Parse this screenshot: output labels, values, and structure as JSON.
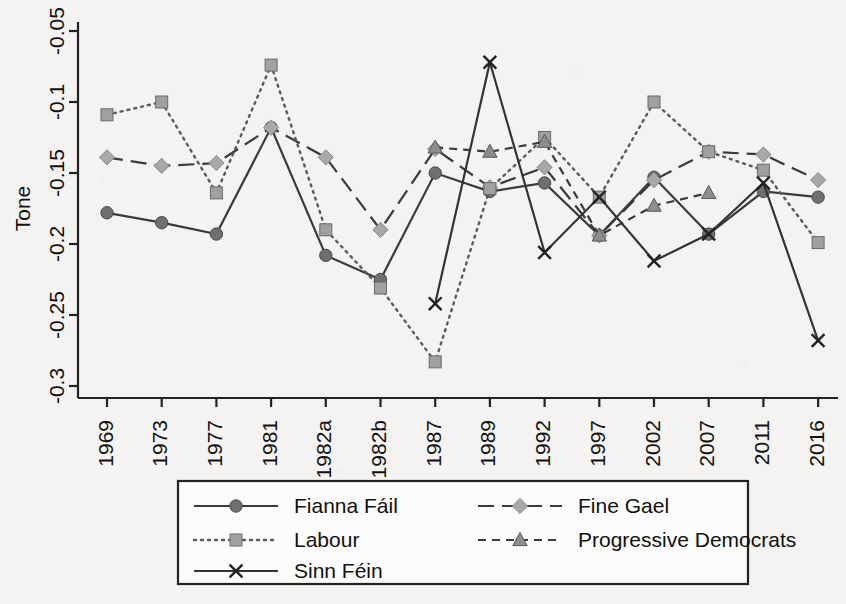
{
  "chart_data": {
    "type": "line",
    "title": "",
    "xlabel": "",
    "ylabel": "Tone",
    "ylim": [
      -0.3,
      -0.05
    ],
    "yticks": [
      "-0.05",
      "-0.1",
      "-0.15",
      "-0.2",
      "-0.25",
      "-0.3"
    ],
    "ytick_values": [
      -0.05,
      -0.1,
      -0.15,
      -0.2,
      -0.25,
      -0.3
    ],
    "grid": false,
    "legend_position": "bottom",
    "categories": [
      "1969",
      "1973",
      "1977",
      "1981",
      "1982a",
      "1982b",
      "1987",
      "1989",
      "1992",
      "1997",
      "2002",
      "2007",
      "2011",
      "2016"
    ],
    "series": [
      {
        "name": "Fianna Fáil",
        "marker": "circle",
        "dash": "solid",
        "color": "#6f6f6f",
        "line_color": "#3a3a3a",
        "values": [
          -0.178,
          -0.185,
          -0.193,
          -0.118,
          -0.208,
          -0.225,
          -0.15,
          -0.163,
          -0.157,
          -0.194,
          -0.153,
          -0.193,
          -0.163,
          -0.167
        ]
      },
      {
        "name": "Fine Gael",
        "marker": "diamond",
        "dash": "longdash",
        "color": "#a8a8a8",
        "line_color": "#3a3a3a",
        "values": [
          -0.139,
          -0.145,
          -0.143,
          -0.118,
          -0.139,
          -0.19,
          -0.133,
          -0.16,
          -0.146,
          -0.194,
          -0.155,
          -0.135,
          -0.137,
          -0.155
        ]
      },
      {
        "name": "Labour",
        "marker": "square",
        "dash": "dotted",
        "color": "#a0a0a0",
        "line_color": "#5a5a5a",
        "values": [
          -0.109,
          -0.1,
          -0.164,
          -0.074,
          -0.19,
          -0.231,
          -0.283,
          -0.161,
          -0.125,
          -0.167,
          -0.1,
          -0.135,
          -0.148,
          -0.199
        ]
      },
      {
        "name": "Progressive Democrats",
        "marker": "triangle",
        "dash": "dashed",
        "color": "#8d8d8d",
        "line_color": "#3a3a3a",
        "values": [
          null,
          null,
          null,
          null,
          null,
          null,
          -0.132,
          -0.135,
          -0.128,
          -0.194,
          -0.173,
          -0.164,
          null,
          null
        ]
      },
      {
        "name": "Sinn Féin",
        "marker": "x",
        "dash": "solid",
        "color": "#222222",
        "line_color": "#333333",
        "values": [
          null,
          null,
          null,
          null,
          null,
          null,
          -0.242,
          -0.072,
          -0.206,
          -0.167,
          -0.212,
          -0.193,
          -0.157,
          -0.268
        ]
      }
    ]
  },
  "legend": {
    "items": [
      {
        "label": "Fianna Fáil"
      },
      {
        "label": "Fine Gael"
      },
      {
        "label": "Labour"
      },
      {
        "label": "Progressive Democrats"
      },
      {
        "label": "Sinn Féin"
      }
    ]
  }
}
